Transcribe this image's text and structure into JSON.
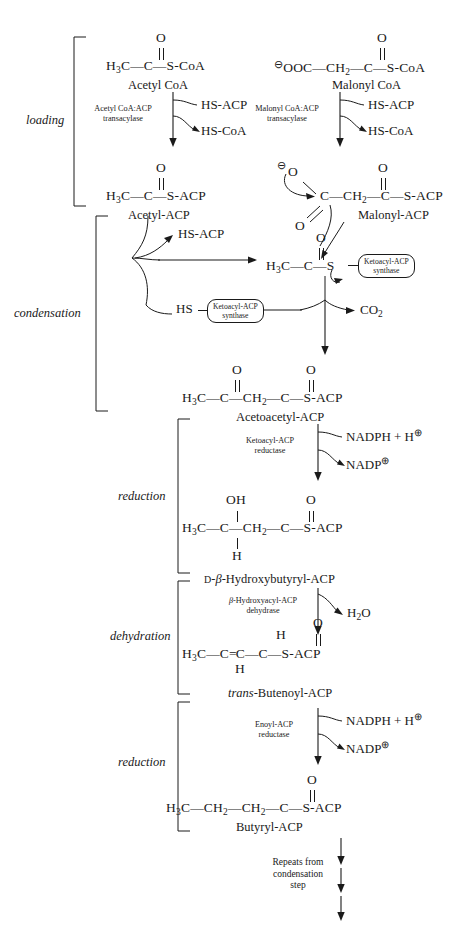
{
  "diagram": {
    "stages": [
      {
        "id": "loading",
        "label": "loading"
      },
      {
        "id": "condensation",
        "label": "condensation"
      },
      {
        "id": "reduction-1",
        "label": "reduction"
      },
      {
        "id": "dehydration",
        "label": "dehydration"
      },
      {
        "id": "reduction-2",
        "label": "reduction"
      }
    ],
    "molecules": {
      "acetyl_coa": {
        "name": "Acetyl CoA",
        "formula_parts": [
          "H",
          "3",
          "C",
          "C",
          "S-CoA"
        ],
        "carbonyl_o": "O"
      },
      "malonyl_coa": {
        "name": "Malonyl CoA",
        "charge": "⊖",
        "formula_parts": [
          "OOC",
          "CH",
          "2",
          "C",
          "S-CoA"
        ],
        "carbonyl_o": "O"
      },
      "acetyl_acp": {
        "name": "Acetyl-ACP",
        "formula_parts": [
          "H",
          "3",
          "C",
          "C",
          "S-ACP"
        ],
        "carbonyl_o": "O"
      },
      "malonyl_acp": {
        "name": "Malonyl-ACP",
        "charge": "⊖",
        "formula_parts": [
          "O",
          "C",
          "CH",
          "2",
          "C",
          "S-ACP"
        ],
        "carbonyl_o": "O",
        "lower_o": "O"
      },
      "acetyl_enzyme": {
        "formula_parts": [
          "H",
          "3",
          "C",
          "C",
          "S"
        ],
        "carbonyl_o": "O"
      },
      "acetoacetyl_acp": {
        "name": "Acetoacetyl-ACP",
        "formula_parts": [
          "H",
          "3",
          "C",
          "C",
          "CH",
          "2",
          "C",
          "S-ACP"
        ],
        "carbonyl_o_1": "O",
        "carbonyl_o_2": "O"
      },
      "hydroxybutyryl_acp": {
        "name_prefix": "D",
        "name_beta": "β",
        "name_rest": "-Hydroxybutyryl-ACP",
        "formula_parts": [
          "H",
          "3",
          "C",
          "C",
          "CH",
          "2",
          "C",
          "S-ACP"
        ],
        "oh": "OH",
        "h": "H",
        "carbonyl_o": "O"
      },
      "butenoyl_acp": {
        "name_italic": "trans",
        "name_rest": "-Butenoyl-ACP",
        "formula_parts": [
          "H",
          "3",
          "C",
          "C",
          "C",
          "C",
          "S-ACP"
        ],
        "h_top": "H",
        "h_bottom": "H",
        "carbonyl_o": "O"
      },
      "butyryl_acp": {
        "name": "Butyryl-ACP",
        "formula_parts": [
          "H",
          "3",
          "C",
          "CH",
          "2",
          "CH",
          "2",
          "C",
          "S-ACP"
        ],
        "carbonyl_o": "O"
      }
    },
    "enzymes": {
      "acetyl_transacylase": {
        "line1": "Acetyl CoA:ACP",
        "line2": "transacylase"
      },
      "malonyl_transacylase": {
        "line1": "Malonyl CoA:ACP",
        "line2": "transacylase"
      },
      "ketoacyl_synthase_top": {
        "line1": "Ketoacyl-ACP",
        "line2": "synthase"
      },
      "ketoacyl_synthase_bottom": {
        "line1": "Ketoacyl-ACP",
        "line2": "synthase"
      },
      "ketoacyl_reductase": {
        "line1": "Ketoacyl-ACP",
        "line2": "reductase"
      },
      "hydroxyacyl_dehydrase": {
        "line1_beta": "β",
        "line1_rest": "-Hydroxyacyl-ACP",
        "line2": "dehydrase"
      },
      "enoyl_reductase": {
        "line1": "Enoyl-ACP",
        "line2": "reductase"
      }
    },
    "cofactors": {
      "hs_acp_1": "HS-ACP",
      "hs_coa_1": "HS-CoA",
      "hs_acp_2": "HS-ACP",
      "hs_coa_2": "HS-CoA",
      "hs_acp_released": "HS-ACP",
      "hs_label": "HS",
      "co2": {
        "text": "CO",
        "sub": "2"
      },
      "nadph_1": {
        "text": "NADPH + H",
        "charge": "⊕"
      },
      "nadp_1": {
        "text": "NADP",
        "charge": "⊕"
      },
      "h2o": {
        "text": "H",
        "sub": "2",
        "rest": "O"
      },
      "nadph_2": {
        "text": "NADPH + H",
        "charge": "⊕"
      },
      "nadp_2": {
        "text": "NADP",
        "charge": "⊕"
      }
    },
    "footer": {
      "line1": "Repeats from",
      "line2": "condensation",
      "line3": "step"
    },
    "colors": {
      "ink": "#1a1a1a",
      "background": "#ffffff"
    }
  }
}
